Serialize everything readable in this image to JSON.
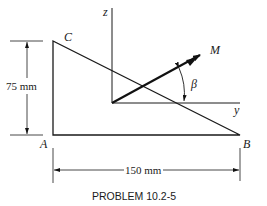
{
  "figure": {
    "points": {
      "A": "A",
      "B": "B",
      "C": "C"
    },
    "axes": {
      "z": "z",
      "y": "y"
    },
    "vector_label": "M",
    "angle_label": "β",
    "dimensions": {
      "height": "75 mm",
      "width": "150 mm"
    },
    "caption": "PROBLEM 10.2-5"
  }
}
